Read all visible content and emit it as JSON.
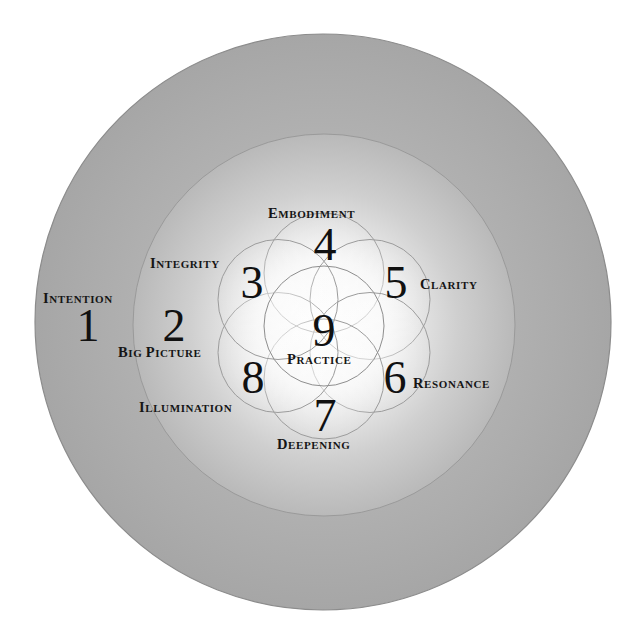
{
  "diagram": {
    "colors": {
      "background": "#ffffff",
      "outer_ring": "#a9a9a9",
      "middle_ring": "#b8b8b8",
      "glow_center": "#ffffff",
      "stroke": "#8a8a8a",
      "text": "#111111"
    },
    "rings": [
      {
        "name": "outer",
        "cx": 323,
        "cy": 322,
        "r": 288
      },
      {
        "name": "middle",
        "cx": 324,
        "cy": 325,
        "r": 191
      }
    ],
    "flower": {
      "cx": 324,
      "cy": 326,
      "r": 60,
      "petal_distance": 53
    },
    "stages": [
      {
        "number": "1",
        "label_first": "I",
        "label_rest": "NTENTION",
        "label": "Intention"
      },
      {
        "number": "2",
        "label_first": "B",
        "label_rest": "IG ",
        "label_first2": "P",
        "label_rest2": "ICTURE",
        "label": "Big Picture"
      },
      {
        "number": "3",
        "label_first": "I",
        "label_rest": "NTEGRITY",
        "label": "Integrity"
      },
      {
        "number": "4",
        "label_first": "E",
        "label_rest": "MBODIMENT",
        "label": "Embodiment"
      },
      {
        "number": "5",
        "label_first": "C",
        "label_rest": "LARITY",
        "label": "Clarity"
      },
      {
        "number": "6",
        "label_first": "R",
        "label_rest": "ESONANCE",
        "label": "Resonance"
      },
      {
        "number": "7",
        "label_first": "D",
        "label_rest": "EEPENING",
        "label": "Deepening"
      },
      {
        "number": "8",
        "label_first": "I",
        "label_rest": "LLUMINATION",
        "label": "Illumination"
      },
      {
        "number": "9",
        "label_first": "P",
        "label_rest": "RACTICE",
        "label": "Practice"
      }
    ]
  }
}
